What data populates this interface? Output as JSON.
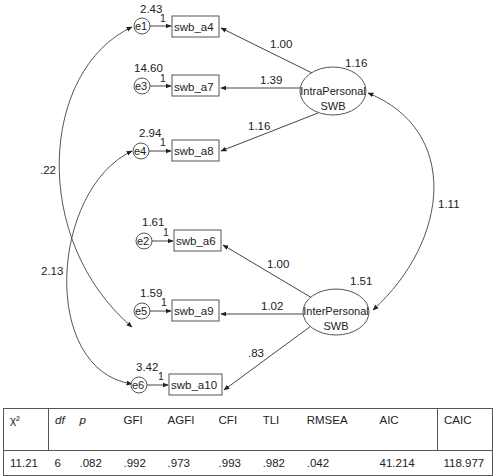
{
  "diagram": {
    "latents": [
      {
        "id": "intra",
        "label_line1": "IntraPersonal",
        "label_line2": "SWB",
        "variance": "1.16"
      },
      {
        "id": "inter",
        "label_line1": "InterPersonal",
        "label_line2": "SWB",
        "variance": "1.51"
      }
    ],
    "indicators": [
      {
        "name": "swb_a4",
        "error": "e1",
        "error_variance": "2.43",
        "fixed": "1",
        "loading": "1.00"
      },
      {
        "name": "swb_a7",
        "error": "e3",
        "error_variance": "14.60",
        "fixed": "1",
        "loading": "1.39"
      },
      {
        "name": "swb_a8",
        "error": "e4",
        "error_variance": "2.94",
        "fixed": "1",
        "loading": "1.16"
      },
      {
        "name": "swb_a6",
        "error": "e2",
        "error_variance": "1.61",
        "fixed": "1",
        "loading": "1.00"
      },
      {
        "name": "swb_a9",
        "error": "e5",
        "error_variance": "1.59",
        "fixed": "1",
        "loading": "1.02"
      },
      {
        "name": "swb_a10",
        "error": "e6",
        "error_variance": "3.42",
        "fixed": "1",
        "loading": ".83"
      }
    ],
    "covariances": [
      {
        "between": "e1-e5",
        "value": ".22"
      },
      {
        "between": "e4-e6",
        "value": "2.13"
      },
      {
        "between": "IntraPersonal-InterPersonal",
        "value": "1.11"
      }
    ]
  },
  "fit_table": {
    "headers": [
      "χ²",
      "df",
      "p",
      "GFI",
      "AGFI",
      "CFI",
      "TLI",
      "RMSEA",
      "AIC",
      "CAIC"
    ],
    "values": [
      "11.21",
      "6",
      ".082",
      ".992",
      ".973",
      ".993",
      ".982",
      ".042",
      "41.214",
      "118.977"
    ]
  }
}
